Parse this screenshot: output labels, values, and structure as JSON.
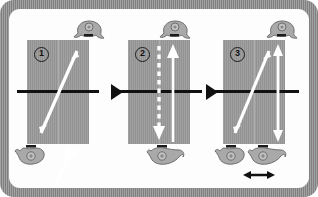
{
  "diagram": {
    "kind": "sports-court-drill-sequence",
    "colors": {
      "frame": "#8e8e8e",
      "card": "#fdfdfd",
      "court": "#9a9a9a",
      "court_line": "#b4b4b4",
      "net_line": "#111111",
      "arrow_white": "#ffffff",
      "arrow_black": "#111111",
      "player": "#a0a0a0",
      "player_outline": "#6e6e6e"
    },
    "panels": [
      {
        "step": "1",
        "badge_label": "1",
        "court_name": "court-panel-1",
        "players": [
          {
            "name": "player-top-right",
            "position": "top-right",
            "facing": "down"
          },
          {
            "name": "player-bottom-left",
            "position": "bottom-left",
            "facing": "up"
          }
        ],
        "arrows": [
          {
            "name": "diagonal-double-arrow",
            "style": "solid",
            "color": "white",
            "heads": "both",
            "direction": "diagonal-up-right"
          }
        ]
      },
      {
        "step": "2",
        "badge_label": "2",
        "court_name": "court-panel-2",
        "players": [
          {
            "name": "player-top-center",
            "position": "top-center",
            "facing": "down"
          },
          {
            "name": "player-bottom-center",
            "position": "bottom-center",
            "facing": "up"
          }
        ],
        "arrows": [
          {
            "name": "dashed-down-arrow",
            "style": "dashed",
            "color": "white",
            "heads": "end",
            "direction": "down"
          },
          {
            "name": "solid-up-arrow",
            "style": "solid",
            "color": "white",
            "heads": "end",
            "direction": "up"
          }
        ]
      },
      {
        "step": "3",
        "badge_label": "3",
        "court_name": "court-panel-3",
        "players": [
          {
            "name": "player-top-right",
            "position": "top-right",
            "facing": "down"
          },
          {
            "name": "player-bottom-left",
            "position": "bottom-left",
            "facing": "up"
          },
          {
            "name": "player-bottom-right",
            "position": "bottom-right",
            "facing": "up"
          }
        ],
        "arrows": [
          {
            "name": "diagonal-double-arrow",
            "style": "solid",
            "color": "white",
            "heads": "both",
            "direction": "diagonal-up-right"
          },
          {
            "name": "vertical-double-arrow",
            "style": "solid",
            "color": "white",
            "heads": "both",
            "direction": "vertical"
          },
          {
            "name": "horizontal-double-arrow",
            "style": "solid",
            "color": "black",
            "heads": "both",
            "direction": "horizontal"
          }
        ]
      }
    ],
    "separators": [
      {
        "name": "step-separator-1",
        "glyph": "triangle-right-icon"
      },
      {
        "name": "step-separator-2",
        "glyph": "triangle-right-icon"
      }
    ]
  }
}
